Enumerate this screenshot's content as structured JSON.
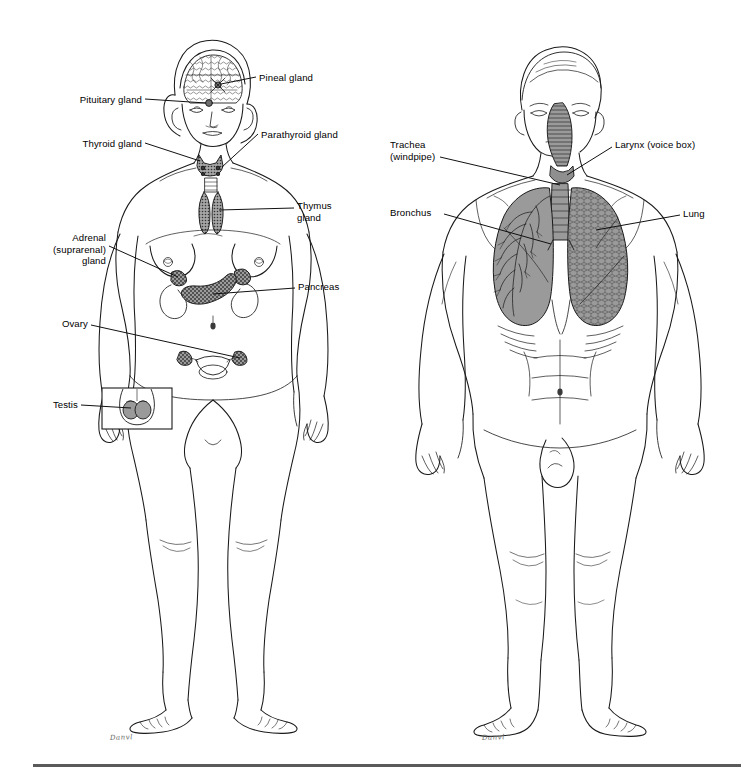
{
  "page": {
    "background": "#ffffff",
    "width": 754,
    "height": 774,
    "rule_color": "#5a5a5a"
  },
  "figures": [
    {
      "id": "endocrine",
      "system": "Endocrine system",
      "subject": "female figure, anterior view",
      "signature": "Danvl",
      "labels": [
        {
          "key": "pineal",
          "text": "Pineal gland",
          "x": 259,
          "y": 79,
          "align": "left"
        },
        {
          "key": "pituitary",
          "text": "Pituitary gland",
          "x": 142,
          "y": 101,
          "align": "right"
        },
        {
          "key": "thyroid",
          "text": "Thyroid gland",
          "x": 142,
          "y": 145,
          "align": "right"
        },
        {
          "key": "parathyroid",
          "text": "Parathyroid gland",
          "x": 261,
          "y": 136,
          "align": "left"
        },
        {
          "key": "thymus",
          "text": "Thymus\ngland",
          "x": 297,
          "y": 204,
          "align": "left"
        },
        {
          "key": "adrenal",
          "text": "Adrenal\n(suprarenal)\ngland",
          "x": 106,
          "y": 234,
          "align": "right"
        },
        {
          "key": "pancreas",
          "text": "Pancreas",
          "x": 298,
          "y": 286,
          "align": "left"
        },
        {
          "key": "ovary",
          "text": "Ovary",
          "x": 88,
          "y": 321,
          "align": "right"
        },
        {
          "key": "testis",
          "text": "Testis",
          "x": 78,
          "y": 405,
          "align": "right"
        }
      ]
    },
    {
      "id": "respiratory",
      "system": "Respiratory system",
      "subject": "male figure, anterior view",
      "signature": "Danvl",
      "labels": [
        {
          "key": "trachea",
          "text": "Trachea\n(windpipe)",
          "x": 60,
          "y": 145,
          "align": "left"
        },
        {
          "key": "larynx",
          "text": "Larynx (voice box)",
          "x": 241,
          "y": 145,
          "align": "left"
        },
        {
          "key": "bronchus",
          "text": "Bronchus",
          "x": 16,
          "y": 210,
          "align": "left"
        },
        {
          "key": "lung",
          "text": "Lung",
          "x": 309,
          "y": 211,
          "align": "left"
        }
      ]
    }
  ],
  "organ_shading": {
    "gland_fill": "#8f8f8f",
    "lung_fill": "#9a9a9a",
    "outline": "#1a1a1a"
  }
}
